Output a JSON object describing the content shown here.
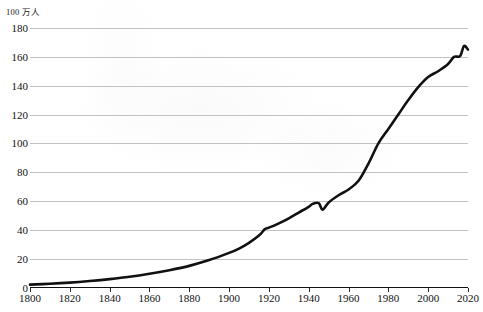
{
  "chart_data": {
    "type": "line",
    "title": "",
    "subtitle": "",
    "xlabel": "",
    "ylabel": "",
    "unit_label": "100 万人",
    "xlim": [
      1800,
      2020
    ],
    "ylim": [
      0,
      180
    ],
    "grid": true,
    "legend": false,
    "legend_position": "none",
    "x_ticks": [
      1800,
      1820,
      1840,
      1860,
      1880,
      1900,
      1920,
      1940,
      1960,
      1980,
      2000,
      2020
    ],
    "y_ticks": [
      0,
      20,
      40,
      60,
      80,
      100,
      120,
      140,
      160,
      180
    ],
    "series": [
      {
        "name": "population",
        "color": "#111111",
        "x": [
          1800,
          1810,
          1820,
          1830,
          1840,
          1850,
          1860,
          1870,
          1880,
          1890,
          1900,
          1905,
          1910,
          1915,
          1918,
          1920,
          1925,
          1930,
          1935,
          1940,
          1942,
          1945,
          1947,
          1950,
          1955,
          1960,
          1965,
          1970,
          1975,
          1980,
          1985,
          1990,
          1995,
          2000,
          2005,
          2010,
          2013,
          2016,
          2018,
          2020
        ],
        "values": [
          2.0,
          2.6,
          3.4,
          4.5,
          5.8,
          7.4,
          9.5,
          12.0,
          15.0,
          19.0,
          24.0,
          27.0,
          31.0,
          36.0,
          40.5,
          41.5,
          44.5,
          48.0,
          52.0,
          56.0,
          58.0,
          58.5,
          54.0,
          59.0,
          64.0,
          68.0,
          74.0,
          86.0,
          100.0,
          110.0,
          120.0,
          130.0,
          139.0,
          146.0,
          150.0,
          155.0,
          160.0,
          160.5,
          167.5,
          165.0
        ]
      }
    ],
    "annotations": []
  },
  "axes": {
    "unit_label": "100 万人",
    "x_tick_labels": [
      "1800",
      "1820",
      "1840",
      "1860",
      "1880",
      "1900",
      "1920",
      "1940",
      "1960",
      "1980",
      "2000",
      "2020"
    ],
    "y_tick_labels": [
      "0",
      "20",
      "40",
      "60",
      "80",
      "100",
      "120",
      "140",
      "160",
      "180"
    ]
  },
  "colors": {
    "line": "#111111",
    "grid": "#b9bcc0",
    "axis": "#111111",
    "background": "#ffffff",
    "text": "#111111"
  }
}
